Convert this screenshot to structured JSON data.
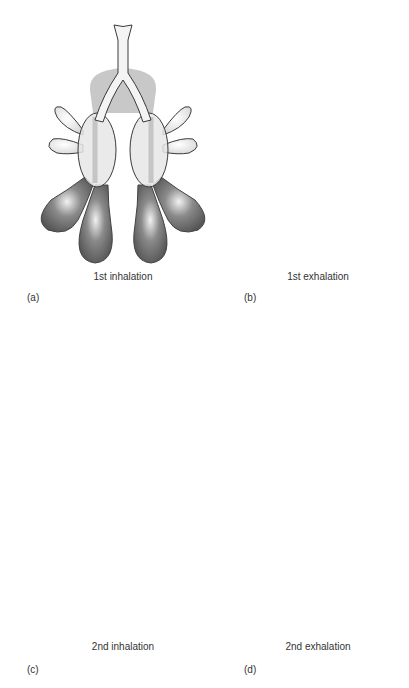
{
  "panels": [
    {
      "id": "a",
      "letter": "(a)",
      "caption": "1st inhalation"
    },
    {
      "id": "b",
      "letter": "(b)",
      "caption": "1st exhalation"
    },
    {
      "id": "c",
      "letter": "(c)",
      "caption": "2nd inhalation"
    },
    {
      "id": "d",
      "letter": "(d)",
      "caption": "2nd exhalation"
    }
  ],
  "colors": {
    "outline": "#3a3a3a",
    "light_fill": "#ececec",
    "mid_fill": "#c4c4c4",
    "dark_fill": "#6e6e6e",
    "pale_fill": "#dcdcdc"
  }
}
